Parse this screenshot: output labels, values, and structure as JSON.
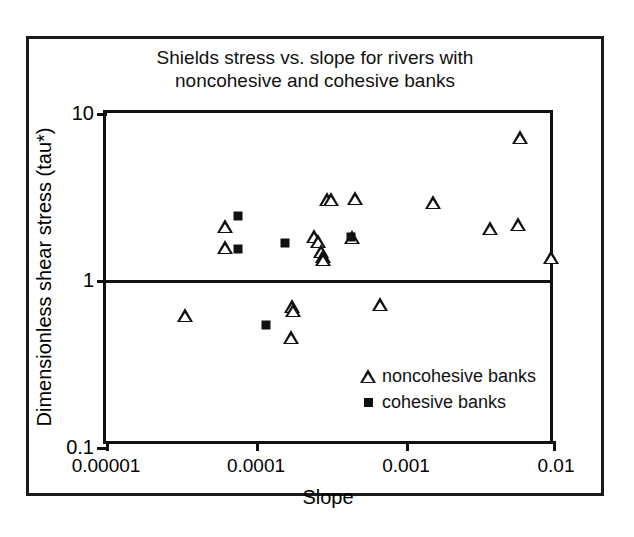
{
  "chart_data": {
    "type": "scatter",
    "title": "Shields stress vs. slope for rivers with\nnoncohesive and cohesive banks",
    "xlabel": "Slope",
    "ylabel": "Dimensionless shear stress (tau*)",
    "xscale": "log",
    "yscale": "log",
    "xlim": [
      1e-05,
      0.01
    ],
    "ylim": [
      0.1,
      10
    ],
    "grid": false,
    "reference_lines": [
      {
        "axis": "y",
        "value": 1
      }
    ],
    "xticks": [
      "0.00001",
      "0.0001",
      "0.001",
      "0.01"
    ],
    "xtick_values": [
      1e-05,
      0.0001,
      0.001,
      0.01
    ],
    "yticks": [
      "10",
      "1",
      "0.1"
    ],
    "ytick_values": [
      10,
      1,
      0.1
    ],
    "legend_position": "lower right",
    "series": [
      {
        "name": "noncohesive banks",
        "marker": "triangle",
        "color": "#111111",
        "points": [
          {
            "x": 6.25e-05,
            "y": 2.12
          },
          {
            "x": 6.25e-05,
            "y": 1.58
          },
          {
            "x": 0.000243,
            "y": 1.84
          },
          {
            "x": 0.000258,
            "y": 1.72
          },
          {
            "x": 0.000272,
            "y": 1.49
          },
          {
            "x": 0.000278,
            "y": 1.4
          },
          {
            "x": 0.000281,
            "y": 1.34
          },
          {
            "x": 0.000296,
            "y": 3.05
          },
          {
            "x": 0.000318,
            "y": 3.05
          },
          {
            "x": 0.000454,
            "y": 3.08
          },
          {
            "x": 0.000438,
            "y": 1.8
          },
          {
            "x": 0.00152,
            "y": 2.92
          },
          {
            "x": 0.00363,
            "y": 2.04
          },
          {
            "x": 0.00574,
            "y": 7.2
          },
          {
            "x": 0.0056,
            "y": 2.15
          },
          {
            "x": 0.0093,
            "y": 1.38
          },
          {
            "x": 3.35e-05,
            "y": 0.62
          },
          {
            "x": 0.000175,
            "y": 0.695
          },
          {
            "x": 0.000177,
            "y": 0.665
          },
          {
            "x": 0.000171,
            "y": 0.455
          },
          {
            "x": 0.000672,
            "y": 0.715
          }
        ]
      },
      {
        "name": "cohesive banks",
        "marker": "square",
        "color": "#111111",
        "points": [
          {
            "x": 7.55e-05,
            "y": 2.42
          },
          {
            "x": 7.55e-05,
            "y": 1.54
          },
          {
            "x": 0.000155,
            "y": 1.66
          },
          {
            "x": 0.000428,
            "y": 1.82
          },
          {
            "x": 0.000116,
            "y": 0.535
          }
        ]
      }
    ]
  },
  "legend": {
    "items": [
      {
        "label": "noncohesive banks",
        "marker": "triangle"
      },
      {
        "label": "cohesive banks",
        "marker": "square"
      }
    ]
  },
  "page": {
    "bottom_caption": ""
  }
}
